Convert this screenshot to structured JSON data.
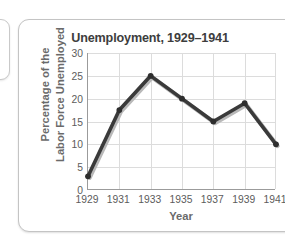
{
  "card": {
    "title": "Unemployment, 1929–1941"
  },
  "chart_data": {
    "type": "line",
    "title": "Unemployment, 1929–1941",
    "xlabel": "Year",
    "ylabel": "Percentage of the Labor Force Unemployed",
    "ylabel_line1": "Percentage of the",
    "ylabel_line2": "Labor Force Unemployed",
    "categories": [
      "1929",
      "1931",
      "1933",
      "1935",
      "1937",
      "1939",
      "1941"
    ],
    "x": [
      1929,
      1931,
      1933,
      1935,
      1937,
      1939,
      1941
    ],
    "values": [
      3,
      17.5,
      25,
      20,
      15,
      19,
      10
    ],
    "series": [
      {
        "name": "Percentage of the Labor Force Unemployed",
        "values": [
          3,
          17.5,
          25,
          20,
          15,
          19,
          10
        ]
      }
    ],
    "xlim": [
      1929,
      1941
    ],
    "ylim": [
      0,
      30
    ],
    "yticks": [
      0,
      5,
      10,
      15,
      20,
      25,
      30
    ],
    "ytick_labels": [
      "0",
      "5",
      "10",
      "15",
      "20",
      "25",
      "30"
    ],
    "xticks": [
      1929,
      1931,
      1933,
      1935,
      1937,
      1939,
      1941
    ],
    "xtick_labels": [
      "1929",
      "1931",
      "1933",
      "1935",
      "1937",
      "1939",
      "1941"
    ],
    "grid": true,
    "legend": false,
    "markers": true,
    "line_color": "#3a3a3a",
    "marker_color": "#2e2e2e",
    "grid_color": "#dcdcdc",
    "axis_color": "#9b9b9b",
    "title_color": "#3d3d3d",
    "axis_label_color": "#6a6a6a",
    "tick_label_color": "#5c5c5c",
    "plot_background": "#ffffff",
    "card_background": "#ffffff",
    "card_border_color": "#c4c4c4"
  }
}
